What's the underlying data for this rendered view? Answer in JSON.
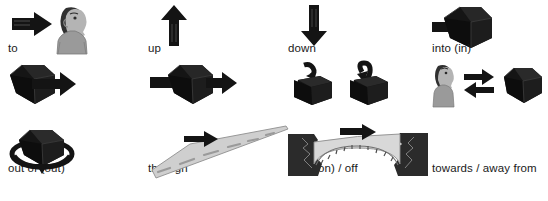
{
  "diagram": {
    "columns": 4,
    "rows": 3,
    "colors": {
      "ink": "#000000",
      "label_text": "#1a1a1a",
      "background": "#ffffff",
      "cube_dark": "#141414",
      "cube_mid": "#232323",
      "cube_light": "#2f2f2f",
      "person_skin": "#b4b4b4",
      "person_hair": "#303030",
      "person_shirt": "#9a9a9a",
      "road_fill": "#cfcfcf",
      "road_line": "#8a8a8a",
      "cliff_dark": "#2b2b2b",
      "bridge_fill": "#d8d8d8",
      "outline": "#555555"
    },
    "items": [
      {
        "id": "to",
        "label": "to",
        "icon": "arrow-right-to-person-icon",
        "row": 0,
        "col": 0
      },
      {
        "id": "up",
        "label": "up",
        "icon": "arrow-up-icon",
        "row": 0,
        "col": 1
      },
      {
        "id": "down",
        "label": "down",
        "icon": "arrow-down-icon",
        "row": 0,
        "col": 2
      },
      {
        "id": "into",
        "label": "into (in)",
        "icon": "arrow-into-cube-icon",
        "row": 0,
        "col": 3
      },
      {
        "id": "out-of",
        "label": "out of (out)",
        "icon": "arrow-out-of-cube-icon",
        "row": 1,
        "col": 0
      },
      {
        "id": "through",
        "label": "through",
        "icon": "arrow-through-cube-icon",
        "row": 1,
        "col": 1
      },
      {
        "id": "onto-off",
        "label": "onto (on) / off",
        "icon": "arrow-onto-off-cubes-icon",
        "row": 1,
        "col": 2
      },
      {
        "id": "towards",
        "label": "towards / away from",
        "icon": "person-arrows-cube-icon",
        "row": 1,
        "col": 3
      },
      {
        "id": "around",
        "label": "around",
        "icon": "arrow-around-cube-icon",
        "row": 2,
        "col": 0
      },
      {
        "id": "along",
        "label": "along",
        "icon": "road-along-icon",
        "row": 2,
        "col": 1
      },
      {
        "id": "across",
        "label": "across",
        "icon": "bridge-across-icon",
        "row": 2,
        "col": 2
      }
    ]
  }
}
